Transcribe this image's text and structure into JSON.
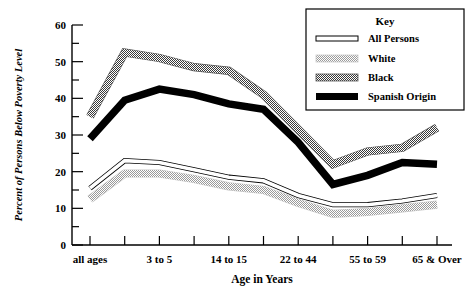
{
  "chart_data": {
    "type": "line",
    "title": "",
    "xlabel": "Age in Years",
    "ylabel": "Percent of Persons Below Poverty Level",
    "ylim": [
      0,
      60
    ],
    "ytick_step": 10,
    "yminor_step": 5,
    "yticks": [
      0,
      10,
      20,
      30,
      40,
      50,
      60
    ],
    "ytick_labels": [
      "0",
      "10",
      "20",
      "30",
      "40",
      "50",
      "60"
    ],
    "grid": false,
    "legend_position": "top-right",
    "legend_title": "Key",
    "categories": [
      "all ages",
      "",
      "3 to 5",
      "",
      "14 to 15",
      "",
      "22 to 44",
      "",
      "55 to 59",
      "",
      "65 & Over"
    ],
    "xtick_count": 11,
    "xtick_labels_shown": [
      "all ages",
      "3 to 5",
      "14 to 15",
      "22 to 44",
      "55 to 59",
      "65 & Over"
    ],
    "series": [
      {
        "name": "All Persons",
        "style": "thin-line",
        "color": "#000000",
        "values": [
          15.5,
          23.0,
          22.5,
          20.5,
          18.5,
          17.5,
          13.5,
          11.0,
          11.0,
          12.0,
          13.5
        ]
      },
      {
        "name": "White",
        "style": "light-hatch",
        "color": "#b3b3b3",
        "values": [
          12.5,
          19.5,
          19.5,
          18.0,
          16.0,
          15.0,
          11.5,
          8.5,
          9.0,
          10.0,
          11.0
        ]
      },
      {
        "name": "Black",
        "style": "dark-hatch",
        "color": "#666666",
        "values": [
          35.0,
          52.5,
          51.0,
          48.5,
          47.5,
          41.0,
          31.5,
          22.0,
          25.5,
          26.5,
          32.0
        ]
      },
      {
        "name": "Spanish Origin",
        "style": "thick-solid",
        "color": "#000000",
        "values": [
          29.0,
          39.5,
          42.5,
          41.0,
          38.5,
          37.0,
          28.0,
          16.5,
          19.0,
          22.5,
          22.0
        ]
      }
    ]
  },
  "legend": {
    "title": "Key",
    "items": [
      {
        "label": "All Persons",
        "swatch": "thin-line-swatch"
      },
      {
        "label": "White",
        "swatch": "light-hatch-swatch"
      },
      {
        "label": "Black",
        "swatch": "dark-hatch-swatch"
      },
      {
        "label": "Spanish Origin",
        "swatch": "solid-black-swatch"
      }
    ]
  },
  "axes": {
    "x_title": "Age in Years",
    "y_title": "Percent of Persons Below Poverty Level"
  }
}
